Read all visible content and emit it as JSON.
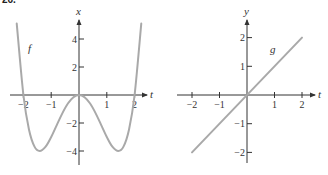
{
  "problem_number": "26.",
  "chart_data": [
    {
      "type": "line",
      "title": "",
      "function_label": "f",
      "expression": "x = t^4 - 4t^2",
      "xlabel": "t",
      "ylabel": "x",
      "xlim": [
        -2.4,
        2.4
      ],
      "ylim": [
        -5,
        5.5
      ],
      "xticks": [
        -2,
        -1,
        1,
        2
      ],
      "xtick_labels": [
        "−2",
        "−1",
        "1",
        "2"
      ],
      "yticks": [
        -4,
        -2,
        2,
        4
      ],
      "ytick_labels": [
        "−4",
        "−2",
        "2",
        "4"
      ],
      "grid": false,
      "series": [
        {
          "name": "f",
          "x": [
            -2.24,
            -2.0,
            -1.8,
            -1.6,
            -1.414,
            -1.2,
            -1.0,
            -0.8,
            -0.6,
            -0.4,
            -0.2,
            0.0,
            0.2,
            0.4,
            0.6,
            0.8,
            1.0,
            1.2,
            1.414,
            1.6,
            1.8,
            2.0,
            2.24
          ],
          "y": [
            5.1,
            0.0,
            -2.46,
            -3.69,
            -4.0,
            -3.69,
            -3.0,
            -2.15,
            -1.31,
            -0.61,
            -0.16,
            0.0,
            -0.16,
            -0.61,
            -1.31,
            -2.15,
            -3.0,
            -3.69,
            -4.0,
            -3.69,
            -2.46,
            0.0,
            5.1
          ]
        }
      ],
      "color": "#a9a9a9"
    },
    {
      "type": "line",
      "title": "",
      "function_label": "g",
      "expression": "y = t",
      "xlabel": "t",
      "ylabel": "y",
      "xlim": [
        -2.4,
        2.5
      ],
      "ylim": [
        -2.4,
        2.6
      ],
      "xticks": [
        -2,
        -1,
        1,
        2
      ],
      "xtick_labels": [
        "−2",
        "−1",
        "1",
        "2"
      ],
      "yticks": [
        -2,
        -1,
        1,
        2
      ],
      "ytick_labels": [
        "−2",
        "−1",
        "1",
        "2"
      ],
      "grid": false,
      "series": [
        {
          "name": "g",
          "x": [
            -2,
            2
          ],
          "y": [
            -2,
            2
          ]
        }
      ],
      "color": "#a9a9a9"
    }
  ]
}
